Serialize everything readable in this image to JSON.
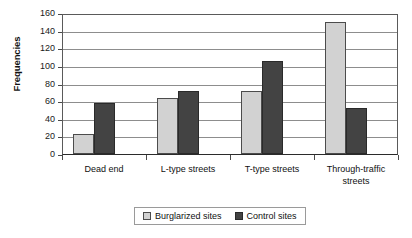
{
  "chart_data": {
    "type": "bar",
    "title": "",
    "subtitle": "",
    "xlabel": "",
    "ylabel": "Frequencies",
    "ylim": [
      0,
      160
    ],
    "ytick_step": 20,
    "yticks": [
      0,
      20,
      40,
      60,
      80,
      100,
      120,
      140,
      160
    ],
    "ytick_labels": [
      "0",
      "20",
      "40",
      "60",
      "80",
      "100",
      "120",
      "140",
      "160"
    ],
    "grid": "horizontal",
    "legend_position": "bottom-center",
    "categories": [
      "Dead end",
      "L-type streets",
      "T-type streets",
      "Through-traffic streets"
    ],
    "series": [
      {
        "name": "Burglarized sites",
        "color": "#d2d2d2",
        "values": [
          23,
          63,
          72,
          150
        ]
      },
      {
        "name": "Control sites",
        "color": "#434343",
        "values": [
          58,
          71,
          105,
          52
        ]
      }
    ]
  },
  "legend": {
    "entries": [
      {
        "label": "Burglarized sites"
      },
      {
        "label": "Control sites"
      }
    ]
  },
  "axis": {
    "y_title": "Frequencies"
  }
}
